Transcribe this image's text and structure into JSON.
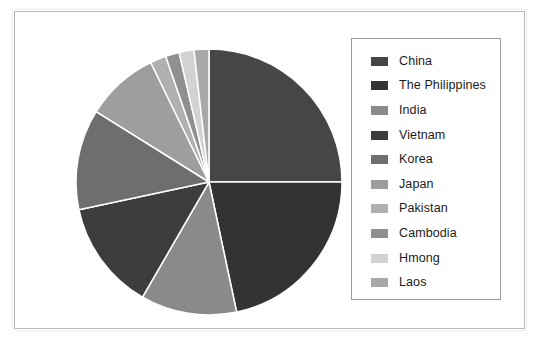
{
  "figure": {
    "background": "#ffffff",
    "border_color": "#b9b9b9"
  },
  "legend": {
    "border_color": "#9a9a9a",
    "position": "right"
  },
  "chart_data": {
    "type": "pie",
    "title": "",
    "subtitle": "",
    "xlabel": "",
    "ylabel": "",
    "grid": false,
    "legend_position": "right",
    "start_angle_deg": 0,
    "direction": "clockwise",
    "center": {
      "x": 148,
      "y": 148
    },
    "radius": 133,
    "separator_color": "#ffffff",
    "separator_width": 1.5,
    "labels": [
      "China",
      "The Philippines",
      "India",
      "Vietnam",
      "Korea",
      "Japan",
      "Pakistan",
      "Cambodia",
      "Hmong",
      "Laos"
    ],
    "values": [
      25.0,
      21.7,
      11.7,
      13.3,
      12.2,
      8.9,
      1.9,
      1.7,
      1.8,
      1.8
    ],
    "angles_deg": [
      90.0,
      78.0,
      42.0,
      48.0,
      44.0,
      32.0,
      7.0,
      6.0,
      6.5,
      6.5
    ],
    "colors": [
      "#464646",
      "#333333",
      "#8a8a8a",
      "#3d3d3d",
      "#6e6e6e",
      "#9e9e9e",
      "#b0b0b0",
      "#8f8f8f",
      "#d2d2d2",
      "#a8a8a8"
    ],
    "slices": [
      {
        "label": "China",
        "value": 25.0,
        "angle_deg": 90.0,
        "color": "#464646"
      },
      {
        "label": "The Philippines",
        "value": 21.7,
        "angle_deg": 78.0,
        "color": "#333333"
      },
      {
        "label": "India",
        "value": 11.7,
        "angle_deg": 42.0,
        "color": "#8a8a8a"
      },
      {
        "label": "Vietnam",
        "value": 13.3,
        "angle_deg": 48.0,
        "color": "#3d3d3d"
      },
      {
        "label": "Korea",
        "value": 12.2,
        "angle_deg": 44.0,
        "color": "#6e6e6e"
      },
      {
        "label": "Japan",
        "value": 8.9,
        "angle_deg": 32.0,
        "color": "#9e9e9e"
      },
      {
        "label": "Pakistan",
        "value": 1.9,
        "angle_deg": 7.0,
        "color": "#b0b0b0"
      },
      {
        "label": "Cambodia",
        "value": 1.7,
        "angle_deg": 6.0,
        "color": "#8f8f8f"
      },
      {
        "label": "Hmong",
        "value": 1.8,
        "angle_deg": 6.5,
        "color": "#d2d2d2"
      },
      {
        "label": "Laos",
        "value": 1.8,
        "angle_deg": 6.5,
        "color": "#a8a8a8"
      }
    ]
  }
}
